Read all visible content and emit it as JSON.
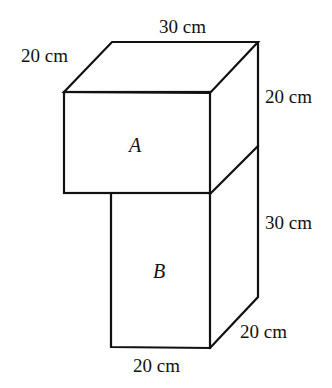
{
  "diagram": {
    "type": "stacked-cuboids",
    "solids": [
      {
        "name": "A",
        "label": "A",
        "length": "30 cm",
        "depth": "20 cm",
        "height": "20 cm"
      },
      {
        "name": "B",
        "label": "B",
        "width": "20 cm",
        "depth": "20 cm",
        "height": "30 cm"
      }
    ],
    "labels": {
      "top_length": "30 cm",
      "top_depth": "20 cm",
      "a_height": "20 cm",
      "b_height": "30 cm",
      "b_depth": "20 cm",
      "b_width": "20 cm"
    },
    "line_color": "#111111",
    "background": "#ffffff"
  }
}
